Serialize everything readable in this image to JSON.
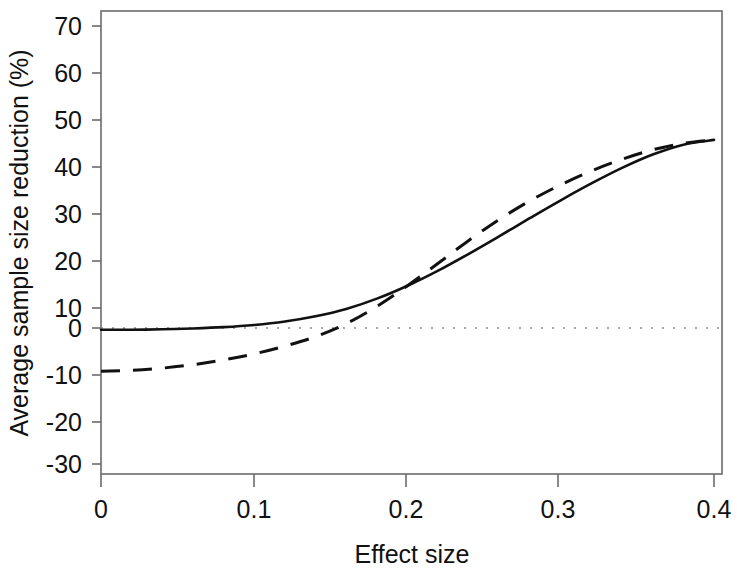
{
  "chart_data": {
    "type": "line",
    "title": "",
    "subtitle": "",
    "xlabel": "Effect size",
    "ylabel": "Average sample size reduction (%)",
    "xlim": [
      0,
      0.4
    ],
    "ylim": [
      -33,
      73
    ],
    "xticks": [
      0,
      0.1,
      0.2,
      0.3,
      0.4
    ],
    "xtick_labels": [
      "0",
      "0.1",
      "0.2",
      "0.3",
      "0.4"
    ],
    "yticks": [
      -30,
      -20,
      -10,
      0,
      10,
      20,
      30,
      40,
      50,
      60,
      70
    ],
    "ytick_labels": [
      "-30",
      "-20",
      "-10",
      "0",
      "10",
      "20",
      "30",
      "40",
      "50",
      "60",
      "70"
    ],
    "grid": false,
    "legend": null,
    "legend_position": "none",
    "annotations": [
      {
        "name": "zero-reference-line",
        "type": "horizontal-dotted-line",
        "y": 0
      }
    ],
    "x": [
      0,
      0.02,
      0.04,
      0.06,
      0.08,
      0.1,
      0.12,
      0.14,
      0.16,
      0.18,
      0.2,
      0.22,
      0.24,
      0.26,
      0.28,
      0.3,
      0.32,
      0.34,
      0.36,
      0.38,
      0.4
    ],
    "series": [
      {
        "name": "solid-curve",
        "style": "solid",
        "color": "#111111",
        "values": [
          -0.4,
          -0.4,
          -0.3,
          -0.1,
          0.2,
          0.7,
          1.5,
          2.7,
          4.4,
          6.8,
          9.8,
          13.3,
          17.2,
          21.3,
          25.5,
          29.6,
          33.5,
          37.1,
          40.2,
          42.5,
          43.6
        ]
      },
      {
        "name": "dashed-curve",
        "style": "dashed",
        "color": "#111111",
        "values": [
          -10.0,
          -9.8,
          -9.3,
          -8.5,
          -7.4,
          -6.0,
          -4.2,
          -2.0,
          1.0,
          5.0,
          9.8,
          15.0,
          20.3,
          25.2,
          29.5,
          33.2,
          36.4,
          39.1,
          41.3,
          42.8,
          43.6
        ]
      }
    ],
    "crossover": {
      "x": 0.15,
      "y": 3.5
    }
  },
  "axes": {
    "x_title": "Effect size",
    "y_title": "Average sample size reduction (%)"
  }
}
